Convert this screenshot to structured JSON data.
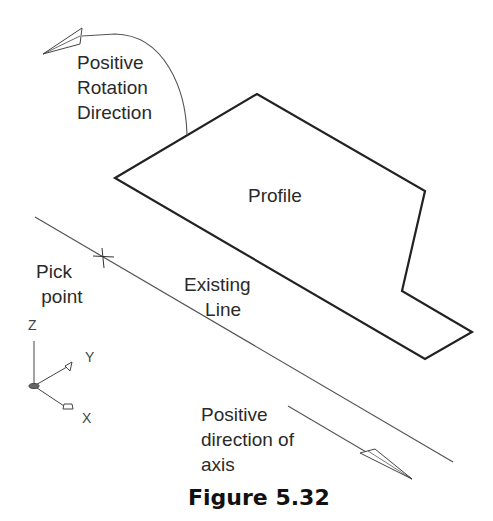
{
  "figure": {
    "caption": "Figure 5.32",
    "labels": {
      "rotation": "Positive\nRotation\nDirection",
      "profile": "Profile",
      "pick_point": "Pick\n point",
      "existing_line": "Existing\n    Line",
      "axis_direction": "Positive\ndirection of\naxis"
    },
    "ucs_axes": {
      "z": "Z",
      "y": "Y",
      "x": "X"
    },
    "colors": {
      "line": "#222222",
      "thin_line": "#555555"
    }
  }
}
